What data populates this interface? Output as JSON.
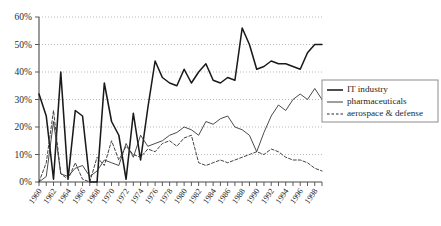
{
  "chart_data": {
    "type": "line",
    "title": "",
    "xlabel": "",
    "ylabel": "",
    "ylim": [
      0,
      60
    ],
    "xlim": [
      1960,
      1999
    ],
    "grid": true,
    "legend_position": "right",
    "y_ticks": [
      "0%",
      "10%",
      "20%",
      "30%",
      "40%",
      "50%",
      "60%"
    ],
    "y_tick_values": [
      0,
      10,
      20,
      30,
      40,
      50,
      60
    ],
    "x_tick_labels": [
      "1960",
      "1962",
      "1964",
      "1966",
      "1968",
      "1970",
      "1972",
      "1974",
      "1976",
      "1978",
      "1980",
      "1982",
      "1984",
      "1986",
      "1988",
      "1990",
      "1992",
      "1994",
      "1996",
      "1998"
    ],
    "x_tick_values": [
      1960,
      1962,
      1964,
      1966,
      1968,
      1970,
      1972,
      1974,
      1976,
      1978,
      1980,
      1982,
      1984,
      1986,
      1988,
      1990,
      1992,
      1994,
      1996,
      1998
    ],
    "x": [
      1960,
      1961,
      1962,
      1963,
      1964,
      1965,
      1966,
      1967,
      1968,
      1969,
      1970,
      1971,
      1972,
      1973,
      1974,
      1975,
      1976,
      1977,
      1978,
      1979,
      1980,
      1981,
      1982,
      1983,
      1984,
      1985,
      1986,
      1987,
      1988,
      1989,
      1990,
      1991,
      1992,
      1993,
      1994,
      1995,
      1996,
      1997,
      1998,
      1999
    ],
    "series": [
      {
        "name": "IT industry",
        "style": "solid-thick",
        "color": "#1a1a1a",
        "values": [
          32,
          24,
          1,
          40,
          1,
          26,
          24,
          0,
          0,
          36,
          22,
          17,
          1,
          25,
          8,
          27,
          44,
          38,
          36,
          35,
          41,
          36,
          40,
          43,
          37,
          36,
          38,
          37,
          56,
          50,
          41,
          42,
          44,
          43,
          43,
          42,
          41,
          47,
          50,
          50
        ]
      },
      {
        "name": "pharmaceuticals",
        "style": "solid-thin",
        "color": "#2b2b2b",
        "values": [
          0,
          2,
          22,
          3,
          2,
          5,
          6,
          2,
          4,
          8,
          7,
          6,
          14,
          9,
          17,
          13,
          14,
          15,
          17,
          18,
          20,
          19,
          17,
          22,
          21,
          23,
          24,
          20,
          19,
          17,
          11,
          18,
          24,
          28,
          26,
          30,
          32,
          30,
          34,
          30
        ]
      },
      {
        "name": "aerospace & defense",
        "style": "dashed",
        "color": "#3a3a3a",
        "values": [
          0,
          7,
          26,
          3,
          1,
          7,
          1,
          0,
          9,
          6,
          15,
          8,
          13,
          10,
          9,
          12,
          11,
          14,
          15,
          13,
          16,
          17,
          7,
          6,
          7,
          8,
          7,
          8,
          9,
          10,
          11,
          10,
          12,
          11,
          9,
          8,
          8,
          7,
          5,
          4
        ]
      }
    ]
  },
  "legend": {
    "items": [
      {
        "label": "IT industry",
        "style": "solid-thick"
      },
      {
        "label": "pharmaceuticals",
        "style": "solid-thin"
      },
      {
        "label": "aerospace & defense",
        "style": "dashed"
      }
    ]
  }
}
